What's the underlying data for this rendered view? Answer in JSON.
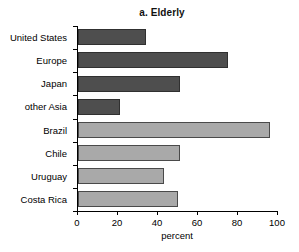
{
  "chart_data": {
    "type": "bar",
    "orientation": "horizontal",
    "title": "a. Elderly",
    "xlabel": "percent",
    "ylabel": "",
    "categories": [
      "United States",
      "Europe",
      "Japan",
      "other Asia",
      "Brazil",
      "Chile",
      "Uruguay",
      "Costa Rica"
    ],
    "values": [
      34,
      75,
      51,
      21,
      96,
      51,
      43,
      50
    ],
    "series": [
      {
        "name": "percent",
        "values": [
          34,
          75,
          51,
          21,
          96,
          51,
          43,
          50
        ]
      }
    ],
    "bar_colors": [
      "#4e4e4e",
      "#4e4e4e",
      "#4e4e4e",
      "#4e4e4e",
      "#a9a9a9",
      "#a9a9a9",
      "#a9a9a9",
      "#a9a9a9"
    ],
    "group_labels": [
      "developed",
      "developed",
      "developed",
      "developed",
      "latin-america",
      "latin-america",
      "latin-america",
      "latin-america"
    ],
    "xlim": [
      0,
      100
    ],
    "xticks": [
      0,
      20,
      40,
      60,
      80,
      100
    ],
    "xtick_labels": [
      "0",
      "20",
      "40",
      "60",
      "80",
      "100"
    ],
    "grid": false,
    "legend": false,
    "colors": {
      "dark_bar": "#4e4e4e",
      "light_bar": "#a9a9a9",
      "axis": "#000000",
      "text": "#000000",
      "background": "#ffffff"
    }
  }
}
